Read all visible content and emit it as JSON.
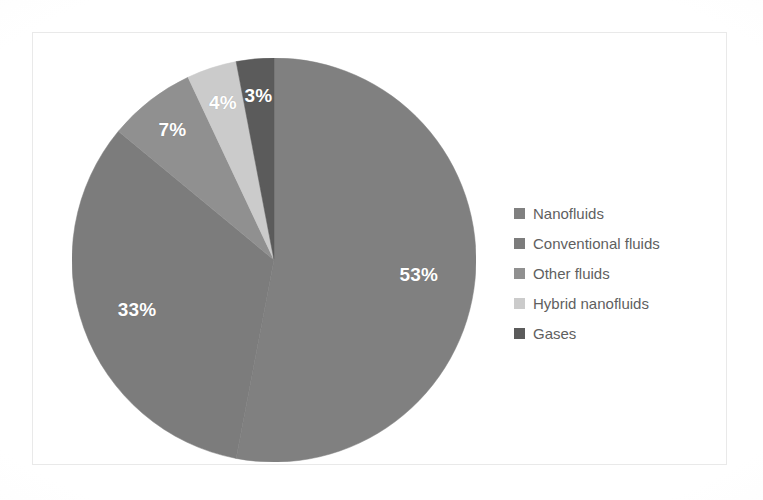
{
  "chart_data": {
    "type": "pie",
    "title": "",
    "subtitle": "",
    "xlabel": "",
    "ylabel": "",
    "grid": false,
    "legend_position": "right",
    "unit": "%",
    "start_angle_deg": 0,
    "direction": "clockwise",
    "categories": [
      "Nanofluids",
      "Conventional fluids",
      "Other fluids",
      "Hybrid nanofluids",
      "Gases"
    ],
    "values": [
      53,
      33,
      7,
      4,
      3
    ],
    "data_labels": [
      "53%",
      "33%",
      "7%",
      "4%",
      "3%"
    ],
    "colors": [
      "#808080",
      "#7c7c7c",
      "#909090",
      "#cbcbcb",
      "#5b5b5b"
    ],
    "slices": [
      {
        "label": "Nanofluids",
        "value": 53,
        "data_label": "53%",
        "color": "#808080"
      },
      {
        "label": "Conventional fluids",
        "value": 33,
        "data_label": "33%",
        "color": "#7c7c7c"
      },
      {
        "label": "Other fluids",
        "value": 7,
        "data_label": "7%",
        "color": "#909090"
      },
      {
        "label": "Hybrid nanofluids",
        "value": 4,
        "data_label": "4%",
        "color": "#cbcbcb"
      },
      {
        "label": "Gases",
        "value": 3,
        "data_label": "3%",
        "color": "#5b5b5b"
      }
    ]
  },
  "legend": {
    "items": [
      {
        "label": "Nanofluids",
        "color": "#808080"
      },
      {
        "label": "Conventional fluids",
        "color": "#7c7c7c"
      },
      {
        "label": "Other fluids",
        "color": "#909090"
      },
      {
        "label": "Hybrid nanofluids",
        "color": "#cbcbcb"
      },
      {
        "label": "Gases",
        "color": "#5b5b5b"
      }
    ]
  },
  "style": {
    "background": "#ffffff",
    "frame_border": "#e9e9e9",
    "label_text_color": "#ffffff",
    "legend_text_color": "#5f5f5f"
  }
}
